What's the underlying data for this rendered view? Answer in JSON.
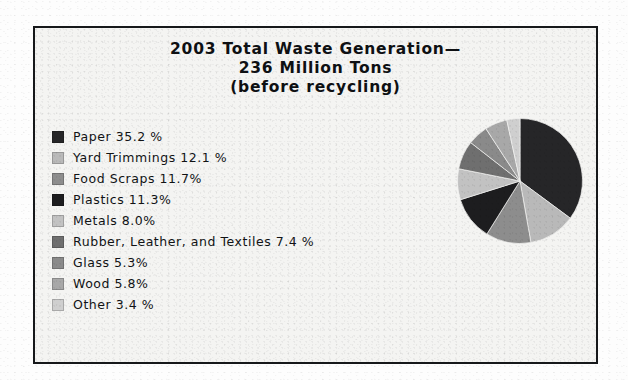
{
  "frame": {
    "border_color": "#16181a",
    "background_color": "#f4f4f2"
  },
  "title": {
    "line1": "2003 Total Waste Generation—",
    "line2": "236 Million Tons",
    "line3": "(before recycling)"
  },
  "legend": {
    "items": [
      {
        "label": "Paper  35.2 %",
        "color": "#262628"
      },
      {
        "label": "Yard Trimmings 12.1 %",
        "color": "#b9b9b9"
      },
      {
        "label": "Food Scraps 11.7%",
        "color": "#8d8d8d"
      },
      {
        "label": "Plastics  11.3%",
        "color": "#1d1d1f"
      },
      {
        "label": "Metals  8.0%",
        "color": "#c2c2c2"
      },
      {
        "label": "Rubber, Leather, and Textiles  7.4 %",
        "color": "#6f6f6f"
      },
      {
        "label": "Glass  5.3%",
        "color": "#8a8a8a"
      },
      {
        "label": "Wood 5.8%",
        "color": "#a8a8a8"
      },
      {
        "label": "Other 3.4 %",
        "color": "#cfcfcf"
      }
    ]
  },
  "chart_data": {
    "type": "pie",
    "unit": "percent",
    "total_label": "236 Million Tons",
    "year": 2003,
    "legend_position": "left",
    "start_angle_deg": 0,
    "direction": "clockwise",
    "categories": [
      "Paper",
      "Yard Trimmings",
      "Food Scraps",
      "Plastics",
      "Metals",
      "Rubber, Leather, and Textiles",
      "Glass",
      "Wood",
      "Other"
    ],
    "values": [
      35.2,
      12.1,
      11.7,
      11.3,
      8.0,
      7.4,
      5.3,
      5.8,
      3.4
    ],
    "value_labels": [
      "35.2 %",
      "12.1 %",
      "11.7%",
      "11.3%",
      "8.0%",
      "7.4 %",
      "5.3%",
      "5.8%",
      "3.4 %"
    ],
    "colors": [
      "#262628",
      "#b9b9b9",
      "#8d8d8d",
      "#1d1d1f",
      "#c2c2c2",
      "#6f6f6f",
      "#8a8a8a",
      "#a8a8a8",
      "#cfcfcf"
    ]
  }
}
